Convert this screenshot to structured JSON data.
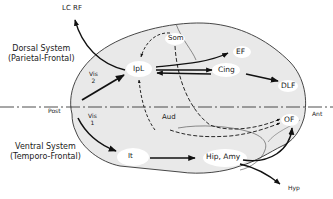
{
  "diagram": {
    "type": "brain-pathway-diagram",
    "systems": {
      "dorsal": {
        "title": "Dorsal System",
        "subtitle": "(Parietal-Frontal)"
      },
      "ventral": {
        "title": "Ventral System",
        "subtitle": "(Temporo-Frontal)"
      }
    },
    "axis": {
      "post": "Post",
      "ant": "Ant"
    },
    "nodes": {
      "lc_rf": "LC  RF",
      "ipl": "IpL",
      "som": "Som",
      "ef": "EF",
      "cing": "Cing",
      "dlf": "DLF",
      "vis2_a": "Vis",
      "vis2_b": "2",
      "vis1_a": "Vis",
      "vis1_b": "1",
      "aud": "Aud",
      "of": "OF",
      "it": "It",
      "hip_amy": "Hip, Amy",
      "hyp": "Hyp"
    },
    "edges": [
      {
        "from": "IpL",
        "to": "LC RF",
        "style": "solid"
      },
      {
        "from": "Vis 2",
        "to": "IpL",
        "style": "solid"
      },
      {
        "from": "IpL",
        "to": "EF",
        "style": "solid"
      },
      {
        "from": "IpL",
        "to": "Cing",
        "style": "solid"
      },
      {
        "from": "Cing",
        "to": "IpL",
        "style": "solid"
      },
      {
        "from": "Cing",
        "to": "DLF",
        "style": "solid"
      },
      {
        "from": "Som",
        "to": "IpL",
        "style": "dashed"
      },
      {
        "from": "Aud",
        "to": "IpL",
        "style": "dashed"
      },
      {
        "from": "Som",
        "to": "OF",
        "style": "dashed"
      },
      {
        "from": "Aud",
        "to": "OF",
        "style": "dashed"
      },
      {
        "from": "Vis 1",
        "to": "It",
        "style": "solid"
      },
      {
        "from": "It",
        "to": "Hip, Amy",
        "style": "solid"
      },
      {
        "from": "Hip, Amy",
        "to": "OF",
        "style": "solid"
      },
      {
        "from": "Hip, Amy",
        "to": "Hyp",
        "style": "solid"
      }
    ]
  }
}
